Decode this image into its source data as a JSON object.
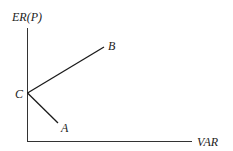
{
  "diagram": {
    "y_axis_label": "ER(P)",
    "x_axis_label": "VAR",
    "points": {
      "C": {
        "label": "C"
      },
      "A": {
        "label": "A"
      },
      "B": {
        "label": "B"
      }
    },
    "colors": {
      "line": "#1a1a1a",
      "text": "#222222",
      "background": "#ffffff"
    }
  }
}
